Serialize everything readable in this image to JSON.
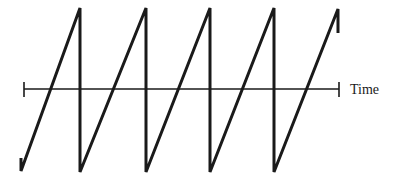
{
  "diagram": {
    "type": "sawtooth-waveform",
    "axis": {
      "label": "Time",
      "y": 89,
      "x_start": 24,
      "x_end": 339
    },
    "waveform": {
      "stroke_color": "#1a1a1a",
      "points": [
        [
          21,
          158
        ],
        [
          21,
          171
        ],
        [
          80,
          8
        ],
        [
          80,
          172
        ],
        [
          146,
          8
        ],
        [
          146,
          172
        ],
        [
          210,
          8
        ],
        [
          210,
          172
        ],
        [
          274,
          8
        ],
        [
          274,
          172
        ],
        [
          338,
          9
        ],
        [
          338,
          33
        ]
      ]
    },
    "colors": {
      "line": "#1a1a1a",
      "background": "#ffffff"
    }
  }
}
